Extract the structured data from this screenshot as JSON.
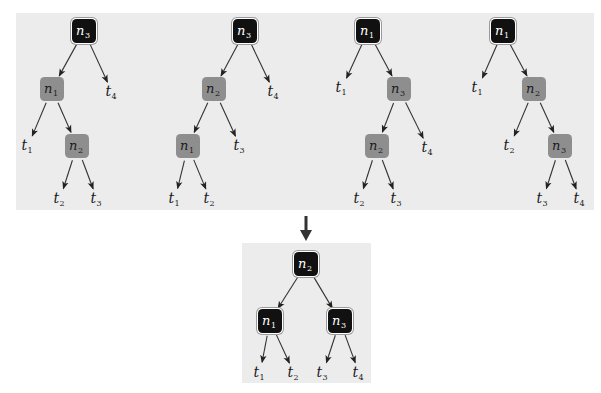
{
  "colors": {
    "panel_bg": "#ececec",
    "dark_node": "#111111",
    "gray_node": "#8e8e8e",
    "edge": "#333333",
    "big_arrow": "#333333"
  },
  "top_trees": [
    {
      "id": "tree-1",
      "nodes": [
        {
          "id": "r",
          "label": "n",
          "sub": "3",
          "type": "dark",
          "x": 84,
          "y": 31
        },
        {
          "id": "a",
          "label": "n",
          "sub": "1",
          "type": "gray",
          "x": 52,
          "y": 89
        },
        {
          "id": "b",
          "label": "n",
          "sub": "2",
          "type": "gray",
          "x": 77,
          "y": 146
        }
      ],
      "leaves": [
        {
          "id": "t4",
          "label": "t",
          "sub": "4",
          "x": 112,
          "y": 92
        },
        {
          "id": "t1",
          "label": "t",
          "sub": "1",
          "x": 28,
          "y": 146
        },
        {
          "id": "t2",
          "label": "t",
          "sub": "2",
          "x": 60,
          "y": 199
        },
        {
          "id": "t3",
          "label": "t",
          "sub": "3",
          "x": 97,
          "y": 199
        }
      ],
      "edges": [
        [
          "r",
          "a"
        ],
        [
          "r",
          "t4"
        ],
        [
          "a",
          "t1"
        ],
        [
          "a",
          "b"
        ],
        [
          "b",
          "t2"
        ],
        [
          "b",
          "t3"
        ]
      ]
    },
    {
      "id": "tree-2",
      "nodes": [
        {
          "id": "r",
          "label": "n",
          "sub": "3",
          "type": "dark",
          "x": 245,
          "y": 31
        },
        {
          "id": "a",
          "label": "n",
          "sub": "2",
          "type": "gray",
          "x": 214,
          "y": 89
        },
        {
          "id": "b",
          "label": "n",
          "sub": "1",
          "type": "gray",
          "x": 188,
          "y": 146
        }
      ],
      "leaves": [
        {
          "id": "t4",
          "label": "t",
          "sub": "4",
          "x": 274,
          "y": 92
        },
        {
          "id": "t3",
          "label": "t",
          "sub": "3",
          "x": 240,
          "y": 146
        },
        {
          "id": "t1",
          "label": "t",
          "sub": "1",
          "x": 175,
          "y": 199
        },
        {
          "id": "t2",
          "label": "t",
          "sub": "2",
          "x": 210,
          "y": 199
        }
      ],
      "edges": [
        [
          "r",
          "a"
        ],
        [
          "r",
          "t4"
        ],
        [
          "a",
          "b"
        ],
        [
          "a",
          "t3"
        ],
        [
          "b",
          "t1"
        ],
        [
          "b",
          "t2"
        ]
      ]
    },
    {
      "id": "tree-3",
      "nodes": [
        {
          "id": "r",
          "label": "n",
          "sub": "1",
          "type": "dark",
          "x": 368,
          "y": 31
        },
        {
          "id": "a",
          "label": "n",
          "sub": "3",
          "type": "gray",
          "x": 399,
          "y": 89
        },
        {
          "id": "b",
          "label": "n",
          "sub": "2",
          "type": "gray",
          "x": 377,
          "y": 146
        }
      ],
      "leaves": [
        {
          "id": "t1",
          "label": "t",
          "sub": "1",
          "x": 342,
          "y": 88
        },
        {
          "id": "t4",
          "label": "t",
          "sub": "4",
          "x": 428,
          "y": 148
        },
        {
          "id": "t2",
          "label": "t",
          "sub": "2",
          "x": 360,
          "y": 199
        },
        {
          "id": "t3",
          "label": "t",
          "sub": "3",
          "x": 397,
          "y": 199
        }
      ],
      "edges": [
        [
          "r",
          "t1"
        ],
        [
          "r",
          "a"
        ],
        [
          "a",
          "b"
        ],
        [
          "a",
          "t4"
        ],
        [
          "b",
          "t2"
        ],
        [
          "b",
          "t3"
        ]
      ]
    },
    {
      "id": "tree-4",
      "nodes": [
        {
          "id": "r",
          "label": "n",
          "sub": "1",
          "type": "dark",
          "x": 503,
          "y": 31
        },
        {
          "id": "a",
          "label": "n",
          "sub": "2",
          "type": "gray",
          "x": 534,
          "y": 89
        },
        {
          "id": "b",
          "label": "n",
          "sub": "3",
          "type": "gray",
          "x": 560,
          "y": 146
        }
      ],
      "leaves": [
        {
          "id": "t1",
          "label": "t",
          "sub": "1",
          "x": 478,
          "y": 88
        },
        {
          "id": "t2",
          "label": "t",
          "sub": "2",
          "x": 510,
          "y": 146
        },
        {
          "id": "t3",
          "label": "t",
          "sub": "3",
          "x": 543,
          "y": 199
        },
        {
          "id": "t4",
          "label": "t",
          "sub": "4",
          "x": 580,
          "y": 199
        }
      ],
      "edges": [
        [
          "r",
          "t1"
        ],
        [
          "r",
          "a"
        ],
        [
          "a",
          "t2"
        ],
        [
          "a",
          "b"
        ],
        [
          "b",
          "t3"
        ],
        [
          "b",
          "t4"
        ]
      ]
    }
  ],
  "transition_arrow": {
    "x": 306,
    "y1": 216,
    "y2": 241
  },
  "result_tree": {
    "id": "balanced-tree",
    "nodes": [
      {
        "id": "r",
        "label": "n",
        "sub": "2",
        "type": "dark",
        "x": 306,
        "y": 264
      },
      {
        "id": "a",
        "label": "n",
        "sub": "1",
        "type": "dark",
        "x": 270,
        "y": 321
      },
      {
        "id": "b",
        "label": "n",
        "sub": "3",
        "type": "dark",
        "x": 340,
        "y": 321
      }
    ],
    "leaves": [
      {
        "id": "t1",
        "label": "t",
        "sub": "1",
        "x": 260,
        "y": 373
      },
      {
        "id": "t2",
        "label": "t",
        "sub": "2",
        "x": 294,
        "y": 373
      },
      {
        "id": "t3",
        "label": "t",
        "sub": "3",
        "x": 323,
        "y": 373
      },
      {
        "id": "t4",
        "label": "t",
        "sub": "4",
        "x": 359,
        "y": 373
      }
    ],
    "edges": [
      [
        "r",
        "a"
      ],
      [
        "r",
        "b"
      ],
      [
        "a",
        "t1"
      ],
      [
        "a",
        "t2"
      ],
      [
        "b",
        "t3"
      ],
      [
        "b",
        "t4"
      ]
    ]
  }
}
